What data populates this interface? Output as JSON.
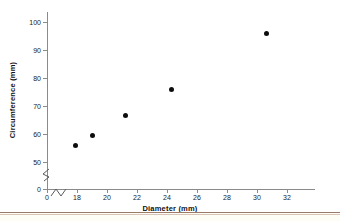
{
  "chart_data": {
    "type": "scatter",
    "title": "",
    "xlabel": "Diameter (mm)",
    "ylabel": "Circumference (mm)",
    "x": [
      17.9,
      19.0,
      21.2,
      24.3,
      30.6
    ],
    "values": [
      56,
      59.5,
      66.5,
      76,
      96
    ],
    "points": [
      {
        "x": 17.9,
        "y": 56
      },
      {
        "x": 19.0,
        "y": 59.5
      },
      {
        "x": 21.2,
        "y": 66.5
      },
      {
        "x": 24.3,
        "y": 76
      },
      {
        "x": 30.6,
        "y": 96
      }
    ],
    "xticks": [
      0,
      18,
      20,
      22,
      24,
      26,
      28,
      30,
      32
    ],
    "xtick_labels": [
      "0",
      "18",
      "20",
      "22",
      "24",
      "26",
      "28",
      "30",
      "32"
    ],
    "yticks": [
      0,
      50,
      60,
      70,
      80,
      90,
      100
    ],
    "ytick_labels": [
      "0",
      "50",
      "60",
      "70",
      "80",
      "90",
      "100"
    ],
    "xlim": [
      0,
      33.5
    ],
    "ylim": [
      0,
      103
    ],
    "grid": false,
    "legend": null,
    "axis_break_x": true,
    "axis_break_y": true,
    "marker": "filled-circle",
    "marker_color": "#0d0d0d",
    "axis_color": "#8a8a8a"
  },
  "figure": {
    "background_color": "#ffffff",
    "footer_rule_color": "#9c7b6a",
    "footer_band_color": "#fdfcf5"
  },
  "icons": {
    "y_axis_break": "axis-break-zigzag",
    "x_axis_break": "axis-break-zigzag"
  }
}
